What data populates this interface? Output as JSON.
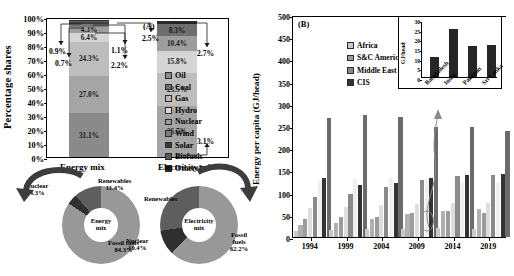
{
  "panel_a": {
    "tag": "(A)",
    "ylabel": "Percentage shares",
    "yticks": [
      "100%",
      "90%",
      "80%",
      "70%",
      "60%",
      "50%",
      "40%",
      "30%",
      "20%",
      "10%",
      "0%"
    ],
    "legend": [
      {
        "label": "Oil",
        "color": "#8a8a8a"
      },
      {
        "label": "Coal",
        "color": "#6e6e6e"
      },
      {
        "label": "Gas",
        "color": "#b9b9b9"
      },
      {
        "label": "Hydro",
        "color": "#d8d8d8"
      },
      {
        "label": "Nuclear",
        "color": "#9a9a9a"
      },
      {
        "label": "Wind",
        "color": "#7d7d7d"
      },
      {
        "label": "Solar",
        "color": "#3a3a3a"
      },
      {
        "label": "Biofuels",
        "color": "#5a5a5a"
      },
      {
        "label": "Others*",
        "color": "#2b2b2b"
      }
    ],
    "bars": [
      {
        "name": "Energy mix",
        "segments": [
          {
            "label": "Oil",
            "value": 31.1,
            "text": "31.1%",
            "color": "#8a8a8a"
          },
          {
            "label": "Coal",
            "value": 27.0,
            "text": "27.0%",
            "color": "#a5a5a5"
          },
          {
            "label": "Gas",
            "value": 24.3,
            "text": "24.3%",
            "color": "#bdbdbd"
          },
          {
            "label": "Hydro",
            "value": 6.4,
            "text": "6.4%",
            "color": "#d5d5d5"
          },
          {
            "label": "Nuclear",
            "value": 4.3,
            "text": "4.3%",
            "color": "#9d9d9d"
          },
          {
            "label": "Wind",
            "value": 2.2,
            "text": "",
            "color": "#787878"
          },
          {
            "label": "Solar",
            "value": 1.1,
            "text": "",
            "color": "#3d3d3d"
          },
          {
            "label": "Biofuels",
            "value": 0.7,
            "text": "",
            "color": "#616161"
          },
          {
            "label": "Others*",
            "value": 0.9,
            "text": "",
            "color": "#2b2b2b"
          }
        ],
        "callouts": [
          {
            "text": "0.9%"
          },
          {
            "text": "0.7%"
          },
          {
            "text": "1.1%"
          },
          {
            "text": "2.2%"
          },
          {
            "text": "2.5%"
          }
        ]
      },
      {
        "name": "Electricity mix",
        "segments": [
          {
            "label": "Coal",
            "value": 36.7,
            "text": "36.7%",
            "color": "#a5a5a5"
          },
          {
            "label": "Gas",
            "value": 23.5,
            "text": "23.5%",
            "color": "#bdbdbd"
          },
          {
            "label": "Hydro",
            "value": 15.8,
            "text": "15.8%",
            "color": "#d5d5d5"
          },
          {
            "label": "Nuclear",
            "value": 10.4,
            "text": "10.4%",
            "color": "#9d9d9d"
          },
          {
            "label": "Wind",
            "value": 8.3,
            "text": "8.3%",
            "color": "#6e6e6e"
          },
          {
            "label": "Others*",
            "value": 2.6,
            "text": "",
            "color": "#2b2b2b"
          }
        ],
        "callouts": [
          {
            "text": "2.7%"
          },
          {
            "text": "3.1%"
          }
        ]
      }
    ],
    "donuts": [
      {
        "title": "Energy mix",
        "center": "Energy\nmix",
        "center_line1": "Energy",
        "center_line2": "mix",
        "slices": [
          {
            "label": "Fossil fuels",
            "value": 84.3,
            "text": "84.3%",
            "color": "#989898"
          },
          {
            "label": "Nuclear",
            "value": 4.3,
            "text": "4.3%",
            "color": "#2f2f2f"
          },
          {
            "label": "Renewables",
            "value": 11.4,
            "text": "11.4%",
            "color": "#5e5e5e"
          }
        ]
      },
      {
        "title": "Electricity mix",
        "center_line1": "Electricity",
        "center_line2": "mix",
        "slices": [
          {
            "label": "Fossil fuels",
            "value": 62.2,
            "text": "62.2%",
            "color": "#989898"
          },
          {
            "label": "Nuclear",
            "value": 10.4,
            "text": "10.4%",
            "color": "#2f2f2f"
          },
          {
            "label": "Renewables",
            "value": 27.4,
            "text": "27.4%",
            "color": "#5e5e5e"
          }
        ]
      }
    ]
  },
  "panel_b": {
    "tag": "(B)",
    "ylabel": "Energy per capita (GJ/head)",
    "yticks": [
      "500",
      "450",
      "400",
      "350",
      "300",
      "250",
      "200",
      "150",
      "100",
      "50",
      "0"
    ],
    "ylim": [
      0,
      500
    ],
    "legend": [
      {
        "label": "Africa",
        "color": "#c9c9c9"
      },
      {
        "label": "Asia Pacific",
        "color": "#b0b0b0"
      },
      {
        "label": "S&C America",
        "color": "#9c9c9c"
      },
      {
        "label": "World",
        "color": "#dedede"
      },
      {
        "label": "Middle East",
        "color": "#8a8a8a"
      },
      {
        "label": "Europe",
        "color": "#efefef"
      },
      {
        "label": "CIS",
        "color": "#333333"
      },
      {
        "label": "North America",
        "color": "#6b6b6b"
      }
    ],
    "chart_data": {
      "type": "bar",
      "title": "",
      "xlabel": "",
      "ylabel": "Energy per capita (GJ/head)",
      "ylim": [
        0,
        500
      ],
      "categories": [
        "1994",
        "1999",
        "2004",
        "2009",
        "2014",
        "2019"
      ],
      "series": [
        {
          "name": "Africa",
          "color": "#c9c9c9",
          "values": [
            14,
            16,
            17,
            18,
            21,
            17
          ]
        },
        {
          "name": "Asia Pacific",
          "color": "#b0b0b0",
          "values": [
            28,
            32,
            41,
            51,
            59,
            62
          ]
        },
        {
          "name": "S&C America",
          "color": "#9c9c9c",
          "values": [
            40,
            44,
            46,
            54,
            58,
            53
          ]
        },
        {
          "name": "World",
          "color": "#dedede",
          "values": [
            66,
            68,
            72,
            75,
            77,
            76
          ]
        },
        {
          "name": "Middle East",
          "color": "#8a8a8a",
          "values": [
            90,
            97,
            113,
            128,
            137,
            140
          ]
        },
        {
          "name": "Europe",
          "color": "#efefef",
          "values": [
            128,
            131,
            134,
            130,
            124,
            123
          ]
        },
        {
          "name": "CIS",
          "color": "#333333",
          "values": [
            132,
            118,
            122,
            133,
            140,
            142
          ]
        },
        {
          "name": "North America",
          "color": "#6b6b6b",
          "values": [
            268,
            275,
            271,
            248,
            247,
            239
          ]
        }
      ]
    },
    "inset": {
      "ylabel": "GJ/head",
      "yticks": [
        "30",
        "25",
        "20",
        "15",
        "10",
        "5",
        "0"
      ],
      "ylim": [
        0,
        30
      ],
      "chart_data": {
        "type": "bar",
        "title": "",
        "xlabel": "",
        "ylabel": "GJ/head",
        "ylim": [
          0,
          30
        ],
        "categories": [
          "Bangladesh",
          "India",
          "Pakistan",
          "Sri Lanka"
        ],
        "values": [
          10.5,
          25.0,
          16.2,
          16.7
        ],
        "color": "#262626"
      }
    }
  }
}
